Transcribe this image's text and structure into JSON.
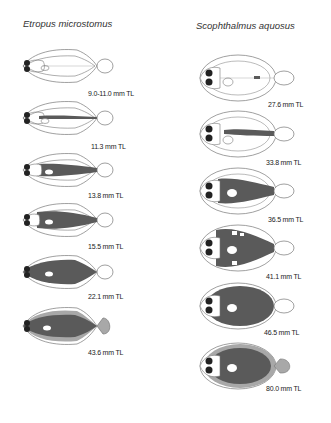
{
  "columns": [
    {
      "species": "Etropus microstomus",
      "stages": [
        {
          "label": "9.0-11.0 mm TL",
          "pigment": "none"
        },
        {
          "label": "11.3 mm TL",
          "pigment": "lateral-stripe"
        },
        {
          "label": "13.8 mm TL",
          "pigment": "trunk-band"
        },
        {
          "label": "15.5 mm TL",
          "pigment": "trunk-wide"
        },
        {
          "label": "22.1 mm TL",
          "pigment": "body-full"
        },
        {
          "label": "43.6 mm TL",
          "pigment": "body-and-fins"
        }
      ]
    },
    {
      "species": "Scophthalmus aquosus",
      "stages": [
        {
          "label": "27.6 mm TL",
          "pigment": "caudal-spot"
        },
        {
          "label": "33.8 mm TL",
          "pigment": "lateral-stripe"
        },
        {
          "label": "36.5 mm TL",
          "pigment": "trunk-band"
        },
        {
          "label": "41.1 mm TL",
          "pigment": "trunk-wide-patches"
        },
        {
          "label": "46.5 mm TL",
          "pigment": "body-full"
        },
        {
          "label": "80.0 mm TL",
          "pigment": "body-and-fins"
        }
      ]
    }
  ],
  "colors": {
    "outline": "#777777",
    "pigment_dark": "#5a5a5a",
    "pigment_light": "#a8a8a8",
    "eye": "#222222"
  }
}
